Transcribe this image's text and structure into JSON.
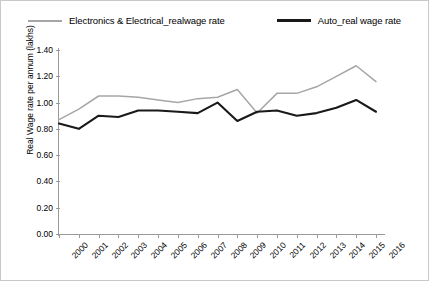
{
  "chart_data": {
    "type": "line",
    "title": "",
    "xlabel": "",
    "ylabel": "Real Wage rate per annum (lakhs)",
    "categories": [
      "2000",
      "2001",
      "2002",
      "2003",
      "2004",
      "2005",
      "2006",
      "2007",
      "2008",
      "2009",
      "2010",
      "2011",
      "2012",
      "2013",
      "2014",
      "2015",
      "2016"
    ],
    "ylim": [
      0.0,
      1.4
    ],
    "ytick_step": 0.2,
    "ytick_labels": [
      "0.00",
      "0.20",
      "0.40",
      "0.60",
      "0.80",
      "1.00",
      "1.20",
      "1.40"
    ],
    "grid": false,
    "legend_position": "top-center",
    "series": [
      {
        "name": "Electronics & Electrical_realwage rate",
        "color": "#a6a6a6",
        "values": [
          0.87,
          0.95,
          1.05,
          1.05,
          1.04,
          1.02,
          1.0,
          1.03,
          1.04,
          1.1,
          0.92,
          1.07,
          1.07,
          1.12,
          1.2,
          1.28,
          1.16
        ]
      },
      {
        "name": "Auto_real wage rate",
        "color": "#191919",
        "values": [
          0.84,
          0.8,
          0.9,
          0.89,
          0.94,
          0.94,
          0.93,
          0.92,
          1.0,
          0.86,
          0.93,
          0.94,
          0.9,
          0.92,
          0.96,
          1.02,
          0.93
        ]
      }
    ]
  },
  "legend": {
    "items": [
      {
        "label": "Electronics & Electrical_realwage rate",
        "style": "gray"
      },
      {
        "label": "Auto_real wage rate",
        "style": "black"
      }
    ]
  }
}
